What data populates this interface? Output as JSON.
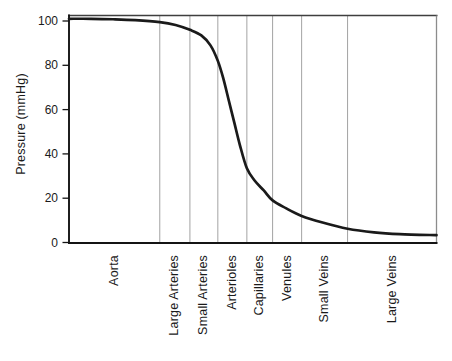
{
  "colors": {
    "background": "#ffffff",
    "curve": "#1a1a1a",
    "gridline": "#a3a3a3",
    "border_top": "#3f3f3f",
    "border_right": "#8c8c8c",
    "axis": "#141414",
    "text": "#1a1a1a"
  },
  "chart_data": {
    "type": "line",
    "ylabel": "Pressure (mmHg)",
    "xlabel": "",
    "ylim": [
      0,
      100
    ],
    "yticks": [
      0,
      20,
      40,
      60,
      80,
      100
    ],
    "grid": "vertical region separators only",
    "legend": "none",
    "categories": [
      "Aorta",
      "Large Arteries",
      "Small Arteries",
      "Arterioles",
      "Capillaries",
      "Venules",
      "Small Veins",
      "Large Veins"
    ],
    "region_boundaries_frac": [
      0,
      0.247,
      0.329,
      0.405,
      0.484,
      0.554,
      0.633,
      0.758,
      1.0
    ],
    "pressure_at_region_boundaries_mmHg": [
      101,
      99.5,
      96,
      82,
      33.5,
      19,
      12,
      6,
      3.3
    ],
    "series": [
      {
        "name": "Blood pressure across vascular tree",
        "color": "#1a1a1a",
        "points": [
          {
            "x": 0.0,
            "y": 101.0
          },
          {
            "x": 0.06,
            "y": 101.0
          },
          {
            "x": 0.12,
            "y": 100.8
          },
          {
            "x": 0.18,
            "y": 100.4
          },
          {
            "x": 0.247,
            "y": 99.5
          },
          {
            "x": 0.29,
            "y": 98.2
          },
          {
            "x": 0.329,
            "y": 96.0
          },
          {
            "x": 0.36,
            "y": 93.5
          },
          {
            "x": 0.385,
            "y": 89.0
          },
          {
            "x": 0.405,
            "y": 82.0
          },
          {
            "x": 0.42,
            "y": 74.0
          },
          {
            "x": 0.435,
            "y": 64.0
          },
          {
            "x": 0.45,
            "y": 54.0
          },
          {
            "x": 0.465,
            "y": 44.0
          },
          {
            "x": 0.484,
            "y": 33.5
          },
          {
            "x": 0.505,
            "y": 28.0
          },
          {
            "x": 0.53,
            "y": 23.5
          },
          {
            "x": 0.554,
            "y": 19.0
          },
          {
            "x": 0.59,
            "y": 15.5
          },
          {
            "x": 0.633,
            "y": 12.0
          },
          {
            "x": 0.69,
            "y": 9.0
          },
          {
            "x": 0.758,
            "y": 6.2
          },
          {
            "x": 0.83,
            "y": 4.6
          },
          {
            "x": 0.9,
            "y": 3.8
          },
          {
            "x": 1.0,
            "y": 3.3
          }
        ]
      }
    ]
  }
}
